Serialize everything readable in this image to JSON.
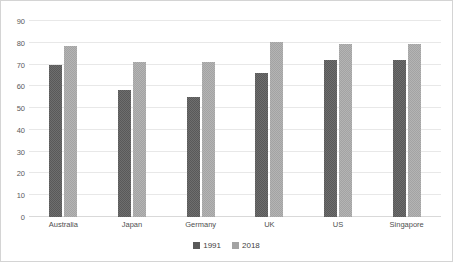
{
  "chart_data": {
    "type": "bar",
    "title": "",
    "xlabel": "",
    "ylabel": "",
    "ylim": [
      0,
      90
    ],
    "yticks": [
      0,
      10,
      20,
      30,
      40,
      50,
      60,
      70,
      80,
      90
    ],
    "grid": true,
    "legend_position": "bottom",
    "categories": [
      "Australia",
      "Japan",
      "Germany",
      "UK",
      "US",
      "Singapore"
    ],
    "series": [
      {
        "name": "1991",
        "color": "#595959",
        "values": [
          70,
          58.5,
          55,
          66,
          72,
          72
        ]
      },
      {
        "name": "2018",
        "color": "#a3a3a3",
        "values": [
          78.5,
          71,
          71,
          80.5,
          79.5,
          79.5
        ]
      }
    ]
  },
  "axis": {
    "y_tick_labels": [
      "90",
      "80",
      "70",
      "60",
      "50",
      "40",
      "30",
      "20",
      "10",
      "0"
    ],
    "x_tick_labels": [
      "Australia",
      "Japan",
      "Germany",
      "UK",
      "US",
      "Singapore"
    ]
  },
  "legend": {
    "entries": [
      {
        "label": "1991"
      },
      {
        "label": "2018"
      }
    ]
  },
  "watermark": {
    "left_text": "",
    "right_text": ""
  }
}
